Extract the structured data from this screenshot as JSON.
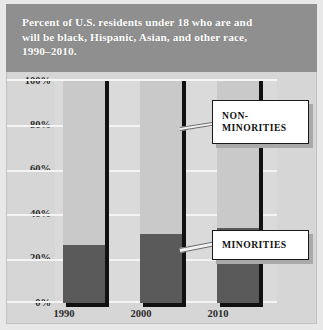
{
  "chart_data": {
    "type": "bar",
    "title": "Percent of U.S. residents under 18 who are and will be black, Hispanic, Asian, and other race, 1990–2010.",
    "title_lines": [
      "Percent of U.S. residents under 18 who are and",
      "will be black, Hispanic, Asian, and other race,",
      "1990–2010."
    ],
    "xlabel": "",
    "ylabel": "",
    "categories": [
      "1990",
      "2000",
      "2010"
    ],
    "series": [
      {
        "name": "MINORITIES",
        "values": [
          26,
          31,
          34
        ]
      },
      {
        "name": "NON-MINORITIES",
        "values": [
          74,
          69,
          66
        ]
      }
    ],
    "values": [
      26,
      31,
      34
    ],
    "ylim": [
      0,
      100
    ],
    "yticks": [
      0,
      20,
      40,
      60,
      80,
      100
    ],
    "ytick_labels": [
      "0%",
      "20%",
      "40%",
      "60%",
      "80%",
      "100%"
    ],
    "grid": true,
    "legend_position": "annotations",
    "stacked": true,
    "units": "percent"
  },
  "annotations": {
    "non_minorities": {
      "label_lines": [
        "NON-",
        "MINORITIES"
      ],
      "label": "NON-MINORITIES"
    },
    "minorities": {
      "label_lines": [
        "MINORITIES"
      ],
      "label": "MINORITIES"
    }
  },
  "colors": {
    "plate_background": "#d6d6d6",
    "title_band": "#8f8f8f",
    "title_text": "#ffffff",
    "plot_background": "#dadada",
    "column_fill": "#c9c9c9",
    "minority_bar": "#5a5a5a",
    "shadow": "#111111",
    "gridline": "#f4f4f4",
    "callout_background": "#ffffff",
    "callout_border": "#1a1a1a",
    "callout_shadow": "#a9a9a9",
    "axis_text": "#2b2b2b"
  }
}
